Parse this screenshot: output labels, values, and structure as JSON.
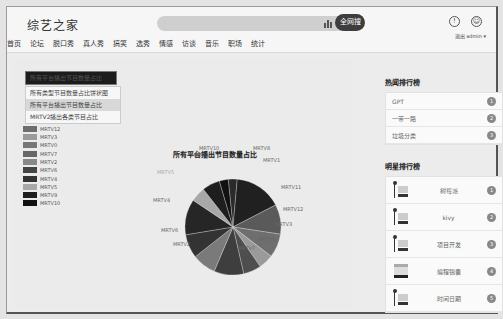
{
  "header": {
    "logo": "综艺之家",
    "search_placeholder": "",
    "search_button": "全网搜",
    "nav": [
      "首页",
      "论坛",
      "脱口秀",
      "真人秀",
      "搞笑",
      "选秀",
      "情感",
      "访谈",
      "音乐",
      "职场",
      "统计"
    ],
    "logout": "退出",
    "user": "admin ▾"
  },
  "dropdown": {
    "selected": "所有平台播出节目数量占比",
    "options": [
      "所有类型节目数量占比饼状图",
      "所有平台播出节目数量占比",
      "MRTV2播出各类节目占比"
    ]
  },
  "chart_data": {
    "type": "pie",
    "title": "所有平台播出节目数量占比",
    "legend_position": "left",
    "legend": [
      "MRTV12",
      "MRTV3",
      "MRTV0",
      "MRTV7",
      "MRTV2",
      "MRTV6",
      "MRTV4",
      "MRTV5",
      "MRTV9",
      "MRTV10"
    ],
    "slices": [
      {
        "label": "MRTV8",
        "value": 3,
        "color": "#2a2a2a"
      },
      {
        "label": "MRTV1",
        "value": 16,
        "color": "#202020"
      },
      {
        "label": "MRTV11",
        "value": 10,
        "color": "#5a5a5a"
      },
      {
        "label": "MRTV12",
        "value": 8,
        "color": "#6e6e6e"
      },
      {
        "label": "MRTV3",
        "value": 5,
        "color": "#9a9a9a"
      },
      {
        "label": "MRTV6",
        "value": 6,
        "color": "#4e4e4e"
      },
      {
        "label": "MRTV7",
        "value": 10,
        "color": "#3e3e3e"
      },
      {
        "label": "MRTV2",
        "value": 8,
        "color": "#7a7a7a"
      },
      {
        "label": "MRTV6",
        "value": 8,
        "color": "#333333"
      },
      {
        "label": "MRTV4",
        "value": 12,
        "color": "#262626"
      },
      {
        "label": "MRTV5",
        "value": 5,
        "color": "#a8a8a8"
      },
      {
        "label": "MRTV9",
        "value": 6,
        "color": "#1e1e1e"
      },
      {
        "label": "MRTV10",
        "value": 3,
        "color": "#111111"
      }
    ]
  },
  "hot": {
    "title": "热闻排行榜",
    "items": [
      {
        "name": "GPT",
        "rank": "1"
      },
      {
        "name": "一带一路",
        "rank": "2"
      },
      {
        "name": "垃圾分类",
        "rank": "3"
      }
    ]
  },
  "stars": {
    "title": "明星排行榜",
    "items": [
      {
        "name": "树莓派",
        "rank": "1"
      },
      {
        "name": "kivy",
        "rank": "2"
      },
      {
        "name": "项目开发",
        "rank": "3"
      },
      {
        "name": "编程锦囊",
        "rank": "4"
      },
      {
        "name": "时间日期",
        "rank": "5"
      }
    ]
  }
}
